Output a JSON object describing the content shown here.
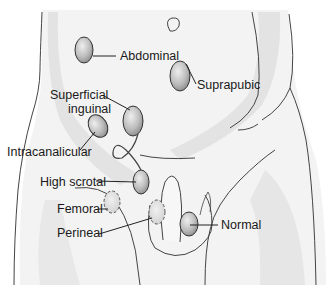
{
  "figure": {
    "type": "anatomical-diagram",
    "labels": [
      {
        "id": "abdominal",
        "text": "Abdominal",
        "x": 120,
        "y": 48
      },
      {
        "id": "suprapubic",
        "text": "Suprapubic",
        "x": 197,
        "y": 79
      },
      {
        "id": "superficial-inguinal-1",
        "text": "Superficial",
        "x": 50,
        "y": 89
      },
      {
        "id": "superficial-inguinal-2",
        "text": "inguinal",
        "x": 68,
        "y": 103
      },
      {
        "id": "intracanalicular",
        "text": "Intracanalicular",
        "x": 7,
        "y": 147
      },
      {
        "id": "high-scrotal",
        "text": "High scrotal",
        "x": 40,
        "y": 179
      },
      {
        "id": "femoral",
        "text": "Femoral",
        "x": 57,
        "y": 203
      },
      {
        "id": "perineal",
        "text": "Perineal",
        "x": 57,
        "y": 226
      },
      {
        "id": "normal",
        "text": "Normal",
        "x": 221,
        "y": 218
      }
    ],
    "colors": {
      "skin": "#f2f2f2",
      "shadow": "#e0e0e0",
      "outline": "#444444",
      "testis_light": "#e6e6e6",
      "testis_dark": "#8f8f8f"
    }
  }
}
